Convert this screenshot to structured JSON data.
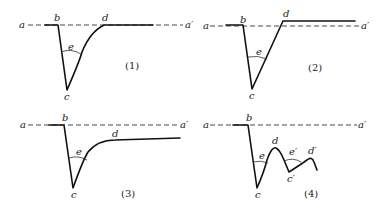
{
  "panels": [
    {
      "id": "1",
      "caption": "(1)",
      "labels": {
        "a": "a",
        "a_prime": "a′",
        "b": "b",
        "c": "c",
        "d": "d",
        "e": "e"
      }
    },
    {
      "id": "2",
      "caption": "(2)",
      "labels": {
        "a": "a",
        "a_prime": "a′",
        "b": "b",
        "c": "c",
        "d": "d",
        "e": "e"
      }
    },
    {
      "id": "3",
      "caption": "(3)",
      "labels": {
        "a": "a",
        "a_prime": "a′",
        "b": "b",
        "c": "c",
        "d": "d",
        "e": "e"
      }
    },
    {
      "id": "4",
      "caption": "(4)",
      "labels": {
        "a": "a",
        "a_prime": "a′",
        "b": "b",
        "c": "c",
        "d": "d",
        "e": "e",
        "c_prime": "c′",
        "d_prime": "d′",
        "e_prime": "e′"
      }
    }
  ]
}
